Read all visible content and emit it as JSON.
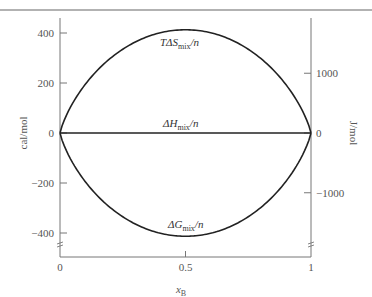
{
  "chart_data": {
    "type": "line",
    "title": "",
    "xlabel": "x_B",
    "xlabel_main": "x",
    "xlabel_sub": "B",
    "ylabel": "cal/mol",
    "ylabel_right": "J/mol",
    "xlim": [
      0,
      1
    ],
    "ylim": [
      -500,
      500
    ],
    "x_ticks": [
      0,
      0.5,
      1
    ],
    "x_tick_labels": [
      "0",
      "0.5",
      "1"
    ],
    "y_ticks_left": [
      400,
      200,
      0,
      -200,
      -400
    ],
    "y_tick_labels_left": [
      "400",
      "200",
      "0",
      "−200",
      "−400"
    ],
    "y_ticks_right_J": [
      1000,
      0,
      -1000
    ],
    "y_tick_labels_right": [
      "1000",
      "0",
      "−1000"
    ],
    "axis_break": true,
    "grid": false,
    "legend": "none (inline labels)",
    "x": [
      0,
      0.05,
      0.1,
      0.2,
      0.3,
      0.4,
      0.5,
      0.6,
      0.7,
      0.8,
      0.9,
      0.95,
      1
    ],
    "series": [
      {
        "name": "TΔS_mix/n",
        "label_main": "TΔS",
        "label_sub": "mix",
        "label_tail": "/n",
        "values": [
          0,
          118,
          194,
          298,
          362,
          400,
          413,
          400,
          362,
          298,
          194,
          118,
          0
        ]
      },
      {
        "name": "ΔH_mix/n",
        "label_main": "ΔH",
        "label_sub": "mix",
        "label_tail": "/n",
        "values": [
          0,
          0,
          0,
          0,
          0,
          0,
          0,
          0,
          0,
          0,
          0,
          0,
          0
        ]
      },
      {
        "name": "ΔG_mix/n",
        "label_main": "ΔG",
        "label_sub": "mix",
        "label_tail": "/n",
        "values": [
          0,
          -118,
          -194,
          -298,
          -362,
          -400,
          -413,
          -400,
          -362,
          -298,
          -194,
          -118,
          0
        ]
      }
    ],
    "annotations": [
      "TΔS_mix/n",
      "ΔH_mix/n",
      "ΔG_mix/n"
    ]
  },
  "colors": {
    "line": "#222222",
    "axis": "#777777",
    "text": "#555555",
    "top_rule": "#666666"
  }
}
